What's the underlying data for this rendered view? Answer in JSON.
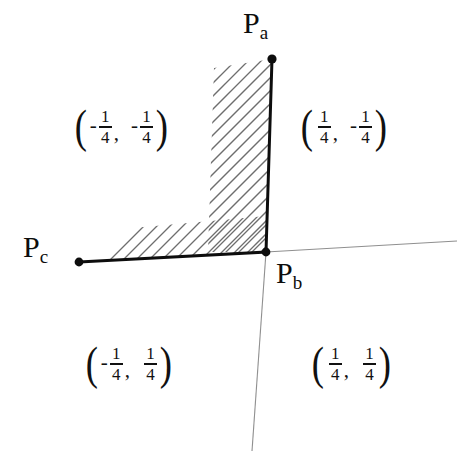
{
  "figure": {
    "background_color": "#ffffff",
    "stroke_color": "#0d0d0d",
    "axis_color": "#8a8a8a",
    "hatch_color": "#6e6e6e",
    "width": 468,
    "height": 453
  },
  "points": [
    {
      "id": "pa",
      "label_base": "P",
      "label_sub": "a",
      "x": 272,
      "y": 59
    },
    {
      "id": "pb",
      "label_base": "P",
      "label_sub": "b",
      "x": 266,
      "y": 252
    },
    {
      "id": "pc",
      "label_base": "P",
      "label_sub": "c",
      "x": 79,
      "y": 262
    }
  ],
  "axes": {
    "horizontal": {
      "x1": 266,
      "y1": 252,
      "x2": 457,
      "y2": 241
    },
    "vertical": {
      "x1": 266,
      "y1": 252,
      "x2": 252,
      "y2": 451
    }
  },
  "path": {
    "description": "thick polyline from Pc to Pb to Pa",
    "vertices": [
      [
        79,
        262
      ],
      [
        266,
        252
      ],
      [
        272,
        59
      ]
    ],
    "stroke_width": 3
  },
  "hatching": {
    "angle_degrees": 45,
    "spacing_px": 13,
    "side": "interior of the L, above the horizontal segment and left of the vertical segment"
  },
  "quadrant_labels": [
    {
      "id": "top-left",
      "position": "top-left",
      "text": "(-1/4, -1/4)",
      "x_sign": "-",
      "x_num": "1",
      "x_den": "4",
      "y_sign": "-",
      "y_num": "1",
      "y_den": "4"
    },
    {
      "id": "top-right",
      "position": "top-right",
      "text": "(1/4, -1/4)",
      "x_sign": "",
      "x_num": "1",
      "x_den": "4",
      "y_sign": "-",
      "y_num": "1",
      "y_den": "4"
    },
    {
      "id": "bottom-left",
      "position": "bottom-left",
      "text": "(-1/4, 1/4)",
      "x_sign": "-",
      "x_num": "1",
      "x_den": "4",
      "y_sign": "",
      "y_num": "1",
      "y_den": "4"
    },
    {
      "id": "bottom-right",
      "position": "bottom-right",
      "text": "(1/4, 1/4)",
      "x_sign": "",
      "x_num": "1",
      "x_den": "4",
      "y_sign": "",
      "y_num": "1",
      "y_den": "4"
    }
  ],
  "glyphs": {
    "open_paren": "(",
    "close_paren": ")",
    "comma": ",",
    "minus": "-"
  }
}
